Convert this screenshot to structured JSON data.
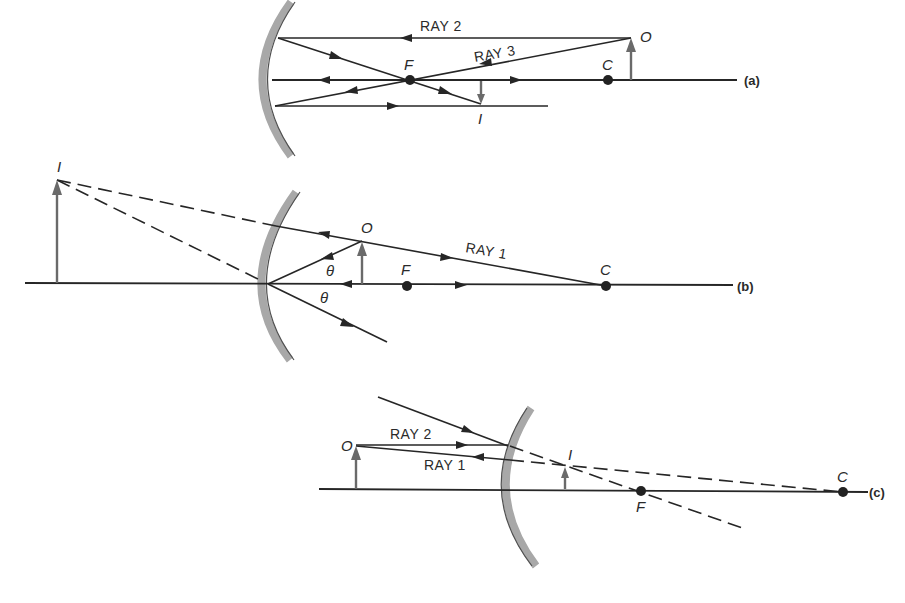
{
  "figure": {
    "panels": [
      {
        "id": "a",
        "panel_label": "(a)",
        "mirror_type": "concave",
        "labels": {
          "object": "O",
          "image": "I",
          "focus": "F",
          "center": "C"
        },
        "rays": [
          {
            "label": "RAY 2"
          },
          {
            "label": "RAY 3"
          }
        ]
      },
      {
        "id": "b",
        "panel_label": "(b)",
        "mirror_type": "concave",
        "labels": {
          "object": "O",
          "image": "I",
          "focus": "F",
          "center": "C",
          "angle_top": "θ",
          "angle_bottom": "θ"
        },
        "rays": [
          {
            "label": "RAY 1"
          }
        ]
      },
      {
        "id": "c",
        "panel_label": "(c)",
        "mirror_type": "convex",
        "labels": {
          "object": "O",
          "image": "I",
          "focus": "F",
          "center": "C"
        },
        "rays": [
          {
            "label": "RAY 2"
          },
          {
            "label": "RAY 1"
          }
        ]
      }
    ],
    "colors": {
      "line": "#262626",
      "mirror": "#a8a8a8",
      "object_arrow": "#6a6a6a",
      "background": "#ffffff"
    }
  }
}
